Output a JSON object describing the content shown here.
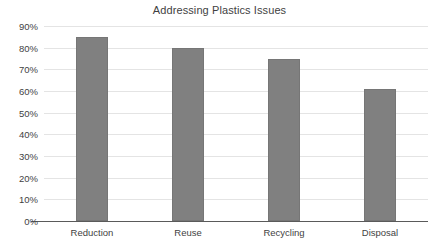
{
  "chart_data": {
    "type": "bar",
    "title": "Addressing Plastics Issues",
    "xlabel": "",
    "ylabel": "",
    "categories": [
      "Reduction",
      "Reuse",
      "Recycling",
      "Disposal"
    ],
    "values": [
      85,
      80,
      75,
      61
    ],
    "ylim": [
      0,
      90
    ],
    "ytick_values": [
      0,
      10,
      20,
      30,
      40,
      50,
      60,
      70,
      80,
      90
    ],
    "ytick_labels": [
      "0%",
      "10%",
      "20%",
      "30%",
      "40%",
      "50%",
      "60%",
      "70%",
      "80%",
      "90%"
    ],
    "grid": true,
    "legend": false,
    "bar_color": "#808080",
    "gridline_color": "#e4e4e4",
    "axis_color": "#5a5a5a",
    "text_color": "#3f3f3f"
  }
}
